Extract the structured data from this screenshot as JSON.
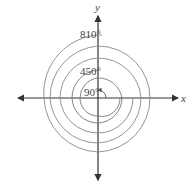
{
  "diagram": {
    "axes": {
      "x_label": "x",
      "y_label": "y"
    },
    "angles": [
      {
        "label": "90°",
        "degrees": 90
      },
      {
        "label": "450°",
        "degrees": 450
      },
      {
        "label": "810°",
        "degrees": 810
      }
    ],
    "colors": {
      "axis": "#333333",
      "arc": "#777777",
      "text": "#444444"
    }
  }
}
